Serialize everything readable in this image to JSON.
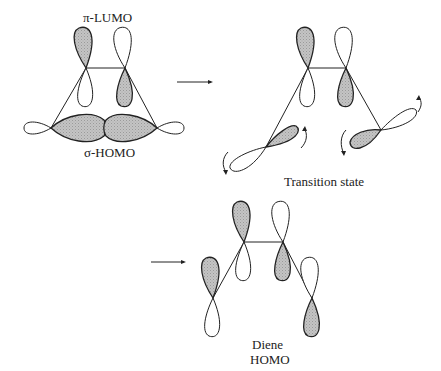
{
  "figure": {
    "labels": {
      "pi_lumo": "π-LUMO",
      "sigma_homo": "σ-HOMO",
      "transition_state": "Transition state",
      "diene_line1": "Diene",
      "diene_line2": "HOMO"
    },
    "colors": {
      "line": "#222222",
      "shaded_lobe": "#bdbdbd",
      "background": "#ffffff"
    },
    "panels": [
      {
        "name": "reactants",
        "caption_top": "π-LUMO",
        "caption_bottom": "σ-HOMO"
      },
      {
        "name": "transition-state",
        "caption_bottom": "Transition state"
      },
      {
        "name": "product",
        "caption_bottom": "Diene HOMO"
      }
    ],
    "arrows": [
      {
        "name": "arrow-reactants-to-ts"
      },
      {
        "name": "arrow-to-diene"
      }
    ]
  }
}
